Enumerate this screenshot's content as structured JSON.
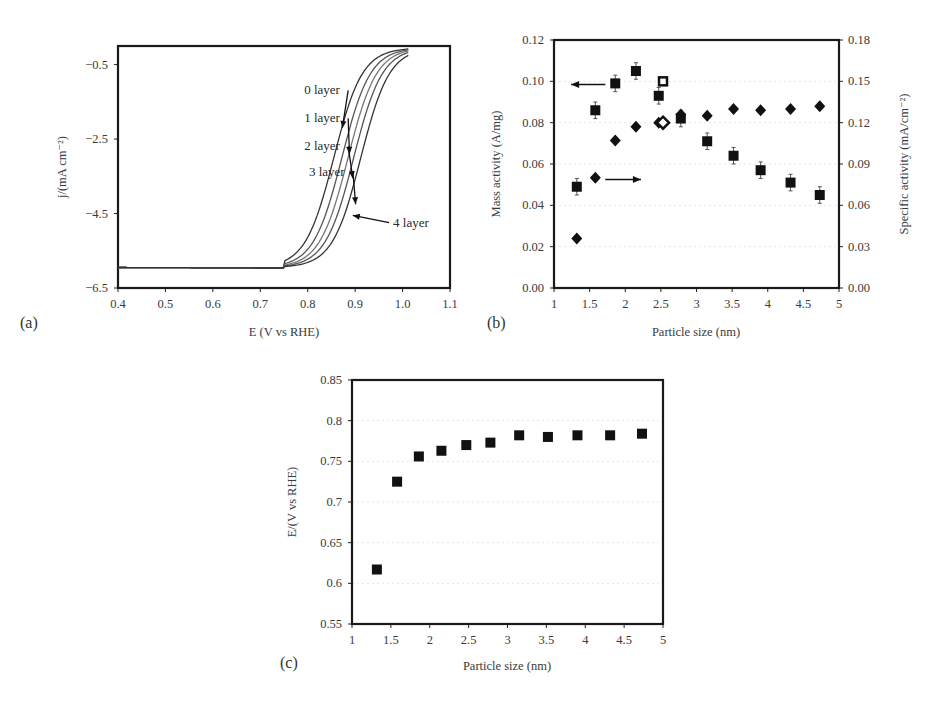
{
  "figure": {
    "panels": [
      "(a)",
      "(b)",
      "(c)"
    ]
  },
  "chart_data": [
    {
      "id": "a",
      "type": "line",
      "panel_label": "(a)",
      "title": "",
      "xlabel": "E (V vs RHE)",
      "ylabel": "j/(mA cm⁻²)",
      "xlim": [
        0.4,
        1.1
      ],
      "ylim": [
        -6.5,
        0.0
      ],
      "xticks": [
        "0.4",
        "0.5",
        "0.6",
        "0.7",
        "0.8",
        "0.9",
        "1.0",
        "1.1"
      ],
      "yticks": [
        "-0.5",
        "-2.5",
        "-4.5",
        "-6.5"
      ],
      "limiting_current": -5.95,
      "series": [
        {
          "name": "0 layer",
          "half_wave_potential": 0.855,
          "color": "#333333"
        },
        {
          "name": "1 layer",
          "half_wave_potential": 0.872,
          "color": "#555555"
        },
        {
          "name": "2 layer",
          "half_wave_potential": 0.885,
          "color": "#777777"
        },
        {
          "name": "3 layer",
          "half_wave_potential": 0.897,
          "color": "#555555"
        },
        {
          "name": "4 layer",
          "half_wave_potential": 0.912,
          "color": "#333333"
        }
      ],
      "annotations": [
        {
          "text": "0 layer",
          "x": 0.86,
          "y": -1.3
        },
        {
          "text": "1 layer",
          "x": 0.86,
          "y": -2.05
        },
        {
          "text": "2 layer",
          "x": 0.86,
          "y": -2.8
        },
        {
          "text": "3 layer",
          "x": 0.87,
          "y": -3.5
        },
        {
          "text": "4 layer",
          "x": 0.98,
          "y": -4.85
        }
      ]
    },
    {
      "id": "b",
      "type": "scatter",
      "panel_label": "(b)",
      "title": "",
      "xlabel": "Particle size (nm)",
      "ylabel": "Mass activity (A/mg)",
      "ylabel_right": "Specific activity (mA/cm⁻²)",
      "xlim": [
        1,
        5
      ],
      "ylim": [
        0.0,
        0.12
      ],
      "ylim_right": [
        0.0,
        0.18
      ],
      "xticks": [
        "1",
        "1.5",
        "2",
        "2.5",
        "3",
        "3.5",
        "4",
        "4.5",
        "5"
      ],
      "yticks": [
        "0.00",
        "0.02",
        "0.04",
        "0.06",
        "0.08",
        "0.10",
        "0.12"
      ],
      "yticks_right": [
        "0.00",
        "0.03",
        "0.06",
        "0.09",
        "0.12",
        "0.15",
        "0.18"
      ],
      "grid": true,
      "series": [
        {
          "name": "Mass activity",
          "marker": "square",
          "axis": "left",
          "x": [
            1.32,
            1.58,
            1.86,
            2.15,
            2.47,
            2.78,
            3.15,
            3.52,
            3.9,
            4.32,
            4.73
          ],
          "y": [
            0.049,
            0.086,
            0.099,
            0.105,
            0.093,
            0.082,
            0.071,
            0.064,
            0.057,
            0.051,
            0.045
          ],
          "err": [
            0.004,
            0.004,
            0.004,
            0.004,
            0.004,
            0.004,
            0.004,
            0.004,
            0.004,
            0.004,
            0.004
          ]
        },
        {
          "name": "Specific activity",
          "marker": "diamond",
          "axis": "right",
          "x": [
            1.32,
            1.58,
            1.86,
            2.15,
            2.47,
            2.78,
            3.15,
            3.52,
            3.9,
            4.32,
            4.73
          ],
          "y": [
            0.036,
            0.08,
            0.107,
            0.117,
            0.12,
            0.126,
            0.125,
            0.13,
            0.129,
            0.13,
            0.132
          ]
        },
        {
          "name": "Mass activity (open)",
          "marker": "open-square",
          "axis": "left",
          "x": [
            2.53
          ],
          "y": [
            0.1
          ]
        },
        {
          "name": "Specific activity (open)",
          "marker": "open-diamond",
          "axis": "right",
          "x": [
            2.53
          ],
          "y": [
            0.12
          ]
        }
      ],
      "annotations": [
        {
          "type": "arrow-left",
          "from_x": 1.72,
          "to_x": 1.24,
          "y": 0.0985,
          "meaning": "points to left axis"
        },
        {
          "type": "arrow-right",
          "from_x": 1.72,
          "to_x": 2.22,
          "y": 0.0525,
          "meaning": "points to right axis"
        }
      ]
    },
    {
      "id": "c",
      "type": "scatter",
      "panel_label": "(c)",
      "title": "",
      "xlabel": "Particle size (nm)",
      "ylabel": "E/(V vs RHE)",
      "xlim": [
        1,
        5
      ],
      "ylim": [
        0.55,
        0.85
      ],
      "xticks": [
        "1",
        "1.5",
        "2",
        "2.5",
        "3",
        "3.5",
        "4",
        "4.5",
        "5"
      ],
      "yticks": [
        "0.55",
        "0.6",
        "0.65",
        "0.7",
        "0.75",
        "0.8",
        "0.85"
      ],
      "grid": true,
      "series": [
        {
          "name": "E",
          "marker": "square",
          "x": [
            1.32,
            1.58,
            1.86,
            2.15,
            2.47,
            2.78,
            3.15,
            3.52,
            3.9,
            4.32,
            4.73
          ],
          "y": [
            0.617,
            0.725,
            0.756,
            0.763,
            0.77,
            0.773,
            0.782,
            0.78,
            0.782,
            0.782,
            0.784
          ]
        }
      ]
    }
  ]
}
